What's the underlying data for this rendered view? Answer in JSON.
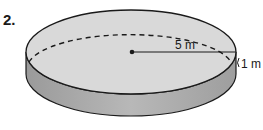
{
  "problem": {
    "number": "2."
  },
  "figure": {
    "shape": "cylinder",
    "radius_label": "5 m",
    "height_label": "1 m",
    "colors": {
      "top_face": "#d9d9d9",
      "side_face": "#a9a9a9",
      "outline": "#1a1a1a"
    }
  }
}
